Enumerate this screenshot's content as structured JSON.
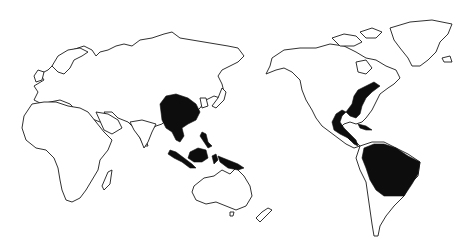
{
  "map": {
    "type": "world-outline-map",
    "projection": "pacific-centered",
    "background_color": "#ffffff",
    "outline_color": "#1a1a1a",
    "highlight_color": "#0d0d0d",
    "highlighted_regions": [
      {
        "name": "Southern China / Indochina",
        "continent": "Asia"
      },
      {
        "name": "Malay Peninsula and Sumatra",
        "continent": "Asia"
      },
      {
        "name": "Borneo",
        "continent": "Asia"
      },
      {
        "name": "Philippines",
        "continent": "Asia"
      },
      {
        "name": "Sulawesi",
        "continent": "Asia"
      },
      {
        "name": "New Guinea",
        "continent": "Oceania"
      },
      {
        "name": "Southeastern United States (Gulf and Atlantic coasts)",
        "continent": "North America"
      },
      {
        "name": "Mexico Gulf coast / Central America",
        "continent": "North America"
      },
      {
        "name": "Cuba",
        "continent": "North America"
      },
      {
        "name": "Northern South America / Amazon basin (Brazil)",
        "continent": "South America"
      }
    ],
    "outlined_regions": [
      "Europe",
      "Africa",
      "Madagascar",
      "Asia",
      "Japan",
      "Australia",
      "New Zealand",
      "North America",
      "Greenland",
      "Arctic Islands",
      "South America"
    ]
  }
}
